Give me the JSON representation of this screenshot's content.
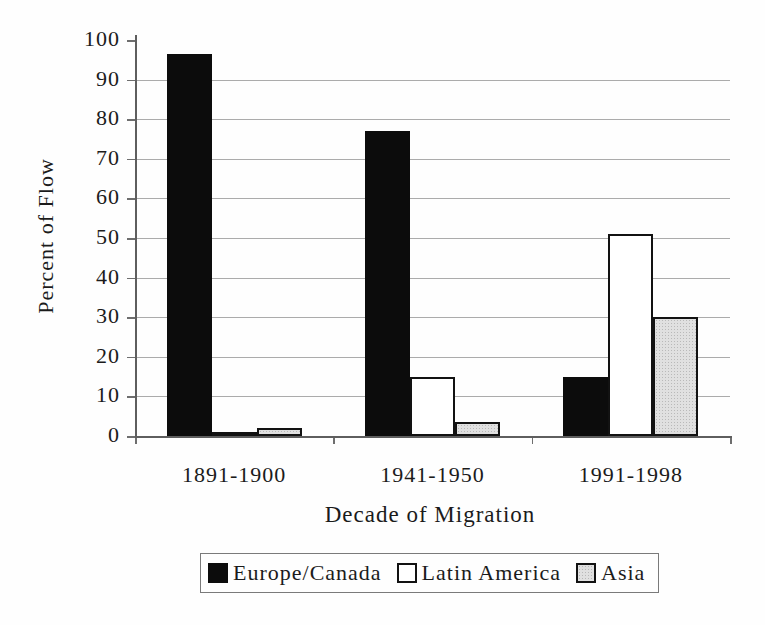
{
  "chart_data": {
    "type": "bar",
    "title": "",
    "xlabel": "Decade of Migration",
    "ylabel": "Percent of Flow",
    "categories": [
      "1891-1900",
      "1941-1950",
      "1991-1998"
    ],
    "series": [
      {
        "name": "Europe/Canada",
        "values": [
          96.5,
          77,
          15
        ],
        "fill": "#0c0c0c",
        "border": "#0c0c0c",
        "pattern": "solid"
      },
      {
        "name": "Latin America",
        "values": [
          1,
          15,
          51
        ],
        "fill": "#ffffff",
        "border": "#121212",
        "pattern": "solid"
      },
      {
        "name": "Asia",
        "values": [
          2,
          3.5,
          30
        ],
        "fill": "#e0e0e0",
        "border": "#121212",
        "pattern": "stipple"
      }
    ],
    "ylim": [
      0,
      100
    ],
    "ytick_step": 10,
    "yticks": [
      0,
      10,
      20,
      30,
      40,
      50,
      60,
      70,
      80,
      90,
      100
    ],
    "grid": true,
    "legend_position": "bottom",
    "colors": {
      "grid": "#ababab",
      "axis": "#5e5e5e",
      "text": "#1b1b1b"
    }
  }
}
